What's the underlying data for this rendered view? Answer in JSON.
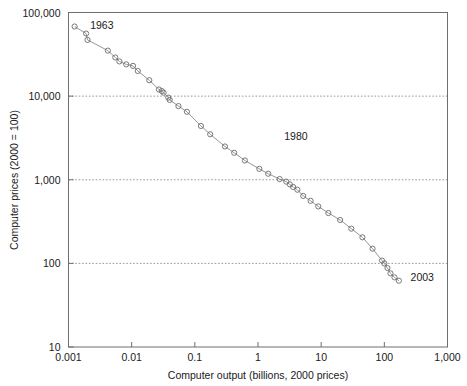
{
  "chart_data": {
    "type": "scatter",
    "title": "",
    "xlabel": "Computer output (billions, 2000 prices)",
    "ylabel": "Computer prices (2000 = 100)",
    "xscale": "log",
    "yscale": "log",
    "xlim": [
      0.001,
      1000
    ],
    "ylim": [
      10,
      100000
    ],
    "xticks": [
      0.001,
      0.01,
      0.1,
      1,
      10,
      100,
      1000
    ],
    "xtick_labels": [
      "0.001",
      "0.01",
      "0.1",
      "1",
      "10",
      "100",
      "1,000"
    ],
    "yticks": [
      10,
      100,
      1000,
      10000,
      100000
    ],
    "ytick_labels": [
      "10",
      "100",
      "1,000",
      "10,000",
      "100,000"
    ],
    "grid": "horizontal dotted gridlines at 100, 1,000 and 10,000",
    "legend": "none",
    "marker": "open circle",
    "line": "solid thin gray connecting line",
    "annotations": [
      {
        "text": "1963",
        "x": 0.0022,
        "y": 64000,
        "anchor": "first-point"
      },
      {
        "text": "1980",
        "x": 2.6,
        "y": 3000,
        "anchor": "mid-series"
      },
      {
        "text": "2003",
        "x": 260,
        "y": 62,
        "anchor": "last-point"
      }
    ],
    "series": [
      {
        "name": "Computer prices vs computer output",
        "points": [
          {
            "year": 1963,
            "x": 0.00125,
            "y": 68000
          },
          {
            "year": 1964,
            "x": 0.0019,
            "y": 56000
          },
          {
            "year": 1965,
            "x": 0.002,
            "y": 47000
          },
          {
            "year": 1966,
            "x": 0.0042,
            "y": 35000
          },
          {
            "year": 1967,
            "x": 0.0055,
            "y": 29000
          },
          {
            "year": 1968,
            "x": 0.0064,
            "y": 26000
          },
          {
            "year": 1969,
            "x": 0.0082,
            "y": 24000
          },
          {
            "year": 1970,
            "x": 0.0105,
            "y": 23000
          },
          {
            "year": 1971,
            "x": 0.0125,
            "y": 20000
          },
          {
            "year": 1972,
            "x": 0.019,
            "y": 15500
          },
          {
            "year": 1973,
            "x": 0.027,
            "y": 12000
          },
          {
            "year": 1974,
            "x": 0.03,
            "y": 11500
          },
          {
            "year": 1975,
            "x": 0.032,
            "y": 11000
          },
          {
            "year": 1976,
            "x": 0.038,
            "y": 9600
          },
          {
            "year": 1977,
            "x": 0.04,
            "y": 9000
          },
          {
            "year": 1978,
            "x": 0.055,
            "y": 7600
          },
          {
            "year": 1979,
            "x": 0.075,
            "y": 6500
          },
          {
            "year": 1980,
            "x": 0.125,
            "y": 4400
          },
          {
            "year": 1981,
            "x": 0.175,
            "y": 3500
          },
          {
            "year": 1982,
            "x": 0.3,
            "y": 2500
          },
          {
            "year": 1983,
            "x": 0.42,
            "y": 2100
          },
          {
            "year": 1984,
            "x": 0.62,
            "y": 1700
          },
          {
            "year": 1985,
            "x": 1.05,
            "y": 1350
          },
          {
            "year": 1986,
            "x": 1.45,
            "y": 1180
          },
          {
            "year": 1987,
            "x": 2.2,
            "y": 1020
          },
          {
            "year": 1988,
            "x": 2.8,
            "y": 950
          },
          {
            "year": 1989,
            "x": 3.2,
            "y": 880
          },
          {
            "year": 1990,
            "x": 3.6,
            "y": 820
          },
          {
            "year": 1991,
            "x": 4.2,
            "y": 760
          },
          {
            "year": 1992,
            "x": 5.2,
            "y": 640
          },
          {
            "year": 1993,
            "x": 6.8,
            "y": 560
          },
          {
            "year": 1994,
            "x": 9.0,
            "y": 480
          },
          {
            "year": 1995,
            "x": 13.0,
            "y": 400
          },
          {
            "year": 1996,
            "x": 20.0,
            "y": 330
          },
          {
            "year": 1997,
            "x": 30.0,
            "y": 260
          },
          {
            "year": 1998,
            "x": 45.0,
            "y": 205
          },
          {
            "year": 1999,
            "x": 65.0,
            "y": 150
          },
          {
            "year": 2000,
            "x": 92.0,
            "y": 108
          },
          {
            "year": 2001,
            "x": 100.0,
            "y": 100
          },
          {
            "year": 2002,
            "x": 112.0,
            "y": 88
          },
          {
            "year": 2003,
            "x": 125.0,
            "y": 76
          },
          {
            "year": 2004,
            "x": 145.0,
            "y": 68
          },
          {
            "year": 2005,
            "x": 170.0,
            "y": 62
          }
        ]
      }
    ]
  },
  "colors": {
    "frame": "#6e6e6e",
    "gridline": "#8c8c8c",
    "marker_stroke": "#6b6b6b",
    "line": "#8a8a8a",
    "text": "#1a1a1a",
    "background": "#ffffff"
  }
}
